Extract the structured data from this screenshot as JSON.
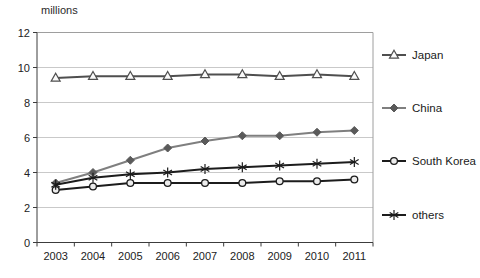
{
  "chart_data": {
    "type": "line",
    "title": "",
    "unit_label": "millions",
    "xlabel": "",
    "ylabel": "millions",
    "categories": [
      "2003",
      "2004",
      "2005",
      "2006",
      "2007",
      "2008",
      "2009",
      "2010",
      "2011"
    ],
    "series": [
      {
        "name": "Japan",
        "marker": "triangle-open",
        "line_color": "#4f4f4f",
        "marker_fill": "#fafafa",
        "marker_stroke": "#4f4f4f",
        "values": [
          9.4,
          9.5,
          9.5,
          9.5,
          9.6,
          9.6,
          9.5,
          9.6,
          9.5
        ]
      },
      {
        "name": "China",
        "marker": "diamond-filled",
        "line_color": "#7f7f7f",
        "marker_fill": "#5a5a5a",
        "marker_stroke": "#5a5a5a",
        "values": [
          3.4,
          4.0,
          4.7,
          5.4,
          5.8,
          6.1,
          6.1,
          6.3,
          6.4
        ]
      },
      {
        "name": "South Korea",
        "marker": "circle-open",
        "line_color": "#1c1c1c",
        "marker_fill": "#ececec",
        "marker_stroke": "#1c1c1c",
        "values": [
          3.0,
          3.2,
          3.4,
          3.4,
          3.4,
          3.4,
          3.5,
          3.5,
          3.6
        ]
      },
      {
        "name": "others",
        "marker": "asterisk",
        "line_color": "#1c1c1c",
        "marker_fill": "none",
        "marker_stroke": "#1c1c1c",
        "values": [
          3.3,
          3.7,
          3.9,
          4.0,
          4.2,
          4.3,
          4.4,
          4.5,
          4.6
        ]
      }
    ],
    "ylim": [
      0,
      12
    ],
    "yticks": [
      0,
      2,
      4,
      6,
      8,
      10,
      12
    ],
    "grid": true,
    "legend_position": "right",
    "colors": {
      "gridline": "#c9c9c9",
      "plot_border": "#9e9e9e",
      "axis": "#3c3c3c",
      "tick_text": "#222222",
      "background": "#ffffff"
    }
  }
}
